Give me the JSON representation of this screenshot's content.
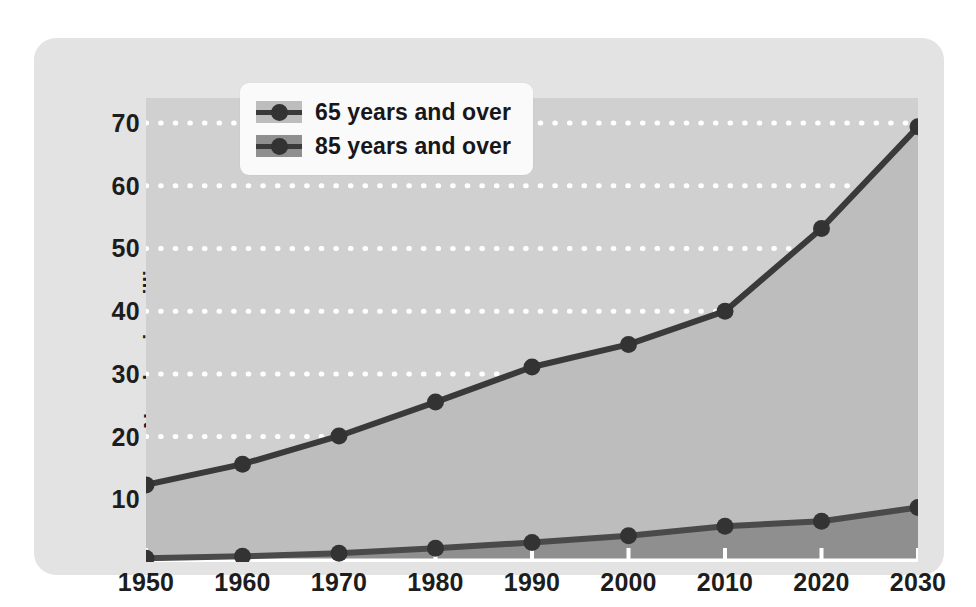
{
  "chart_data": {
    "type": "area",
    "title": "",
    "subtitle": "",
    "xlabel": "",
    "ylabel": "Number in millions",
    "categories": [
      1950,
      1960,
      1970,
      1980,
      1990,
      2000,
      2010,
      2020,
      2030
    ],
    "xtick_labels": [
      "1950",
      "1960",
      "1970",
      "1980",
      "1990",
      "2000",
      "2010",
      "2020",
      "2030"
    ],
    "ytick_labels": [
      "10",
      "20",
      "30",
      "40",
      "50",
      "60",
      "70"
    ],
    "ytick_values": [
      10,
      20,
      30,
      40,
      50,
      60,
      70
    ],
    "xlim": [
      1950,
      2030
    ],
    "ylim": [
      0,
      74
    ],
    "grid": true,
    "grid_style": "dotted-white-horizontal",
    "legend_position": "top-left-inside",
    "series": [
      {
        "name": "65 years and over",
        "values": [
          12.3,
          15.6,
          20.1,
          25.5,
          31.1,
          34.7,
          40.0,
          53.2,
          69.4
        ],
        "line_color": "#3a3a3a",
        "fill_color": "#bdbdbd",
        "marker": "circle"
      },
      {
        "name": "85 years and over",
        "values": [
          0.6,
          0.9,
          1.4,
          2.2,
          3.1,
          4.2,
          5.7,
          6.5,
          8.7
        ],
        "line_color": "#4a4a4a",
        "fill_color": "#8f8f8f",
        "marker": "circle"
      }
    ]
  },
  "legend": {
    "items": [
      {
        "label": "65 years and over",
        "swatch_color": "#bdbdbd"
      },
      {
        "label": "85 years and over",
        "swatch_color": "#8f8f8f"
      }
    ]
  },
  "axes": {
    "y_title": "Number in millions",
    "y_ticks": [
      "10",
      "20",
      "30",
      "40",
      "50",
      "60",
      "70"
    ],
    "x_ticks": [
      "1950",
      "1960",
      "1970",
      "1980",
      "1990",
      "2000",
      "2010",
      "2020",
      "2030"
    ]
  },
  "colors": {
    "page_background": "#ffffff",
    "panel_background": "#e3e3e3",
    "plot_background": "#d0d0d0",
    "gridline": "#ffffff",
    "axis_line": "#ffffff",
    "series_65_fill": "#bdbdbd",
    "series_85_fill": "#8f8f8f",
    "line": "#3a3a3a",
    "marker": "#333333",
    "text": "#1d1d1d",
    "legend_background": "#fafafa"
  }
}
